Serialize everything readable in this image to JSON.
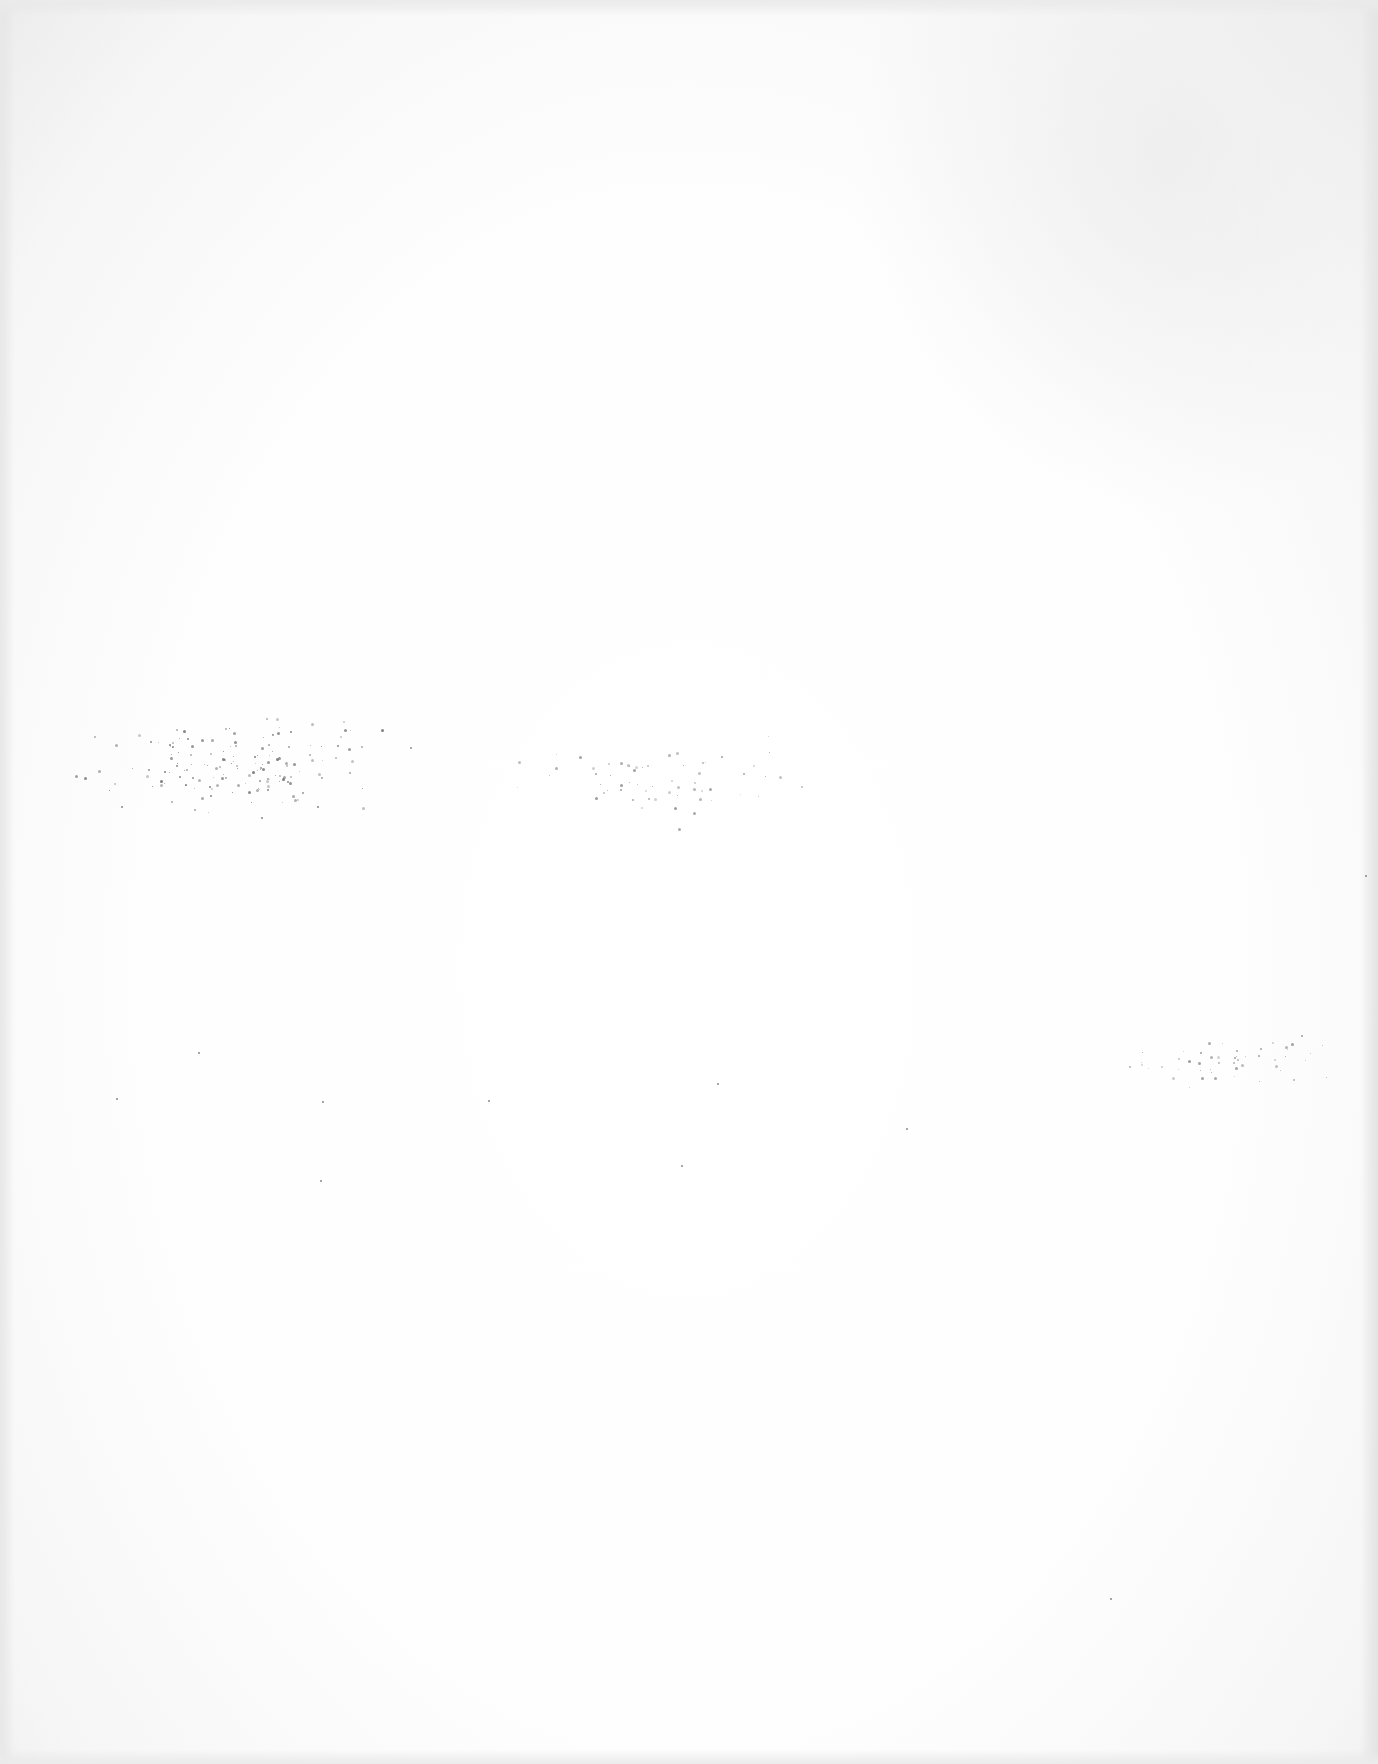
{
  "document": {
    "type": "scanned-page",
    "content": "",
    "is_blank": true
  },
  "artifacts": {
    "speckle_clusters": [
      {
        "x": 55,
        "y": 700,
        "w": 370,
        "h": 130,
        "count": 160,
        "color": "#666666"
      },
      {
        "x": 450,
        "y": 720,
        "w": 420,
        "h": 120,
        "count": 60,
        "color": "#888888"
      },
      {
        "x": 1085,
        "y": 1025,
        "w": 290,
        "h": 70,
        "count": 50,
        "color": "#888888"
      }
    ],
    "isolated_specks": [
      [
        198,
        1052
      ],
      [
        116,
        1098
      ],
      [
        322,
        1101
      ],
      [
        488,
        1100
      ],
      [
        717,
        1083
      ],
      [
        906,
        1128
      ],
      [
        681,
        1165
      ],
      [
        320,
        1180
      ],
      [
        1110,
        1598
      ],
      [
        1365,
        875
      ]
    ]
  }
}
